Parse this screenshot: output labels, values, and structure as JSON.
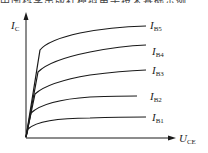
{
  "top_text": "中国科学出版社模拟电子技术基础示例",
  "diagram": {
    "y_axis": {
      "label_main": "I",
      "label_sub": "C"
    },
    "x_axis": {
      "label_main": "U",
      "label_sub": "CE"
    },
    "curves": [
      {
        "label_main": "I",
        "label_sub": "B5",
        "d": "M26,137 L40,50 Q48,40 80,33 Q110,27 146,26",
        "lx": 150,
        "ly": 29
      },
      {
        "label_main": "I",
        "label_sub": "B4",
        "d": "M26,137 L38,72 Q50,60 90,52 Q120,46 146,45",
        "lx": 152,
        "ly": 55
      },
      {
        "label_main": "I",
        "label_sub": "B3",
        "d": "M26,137 L35,94 Q48,82 90,75 Q120,71 146,70",
        "lx": 152,
        "ly": 74
      },
      {
        "label_main": "I",
        "label_sub": "B2",
        "d": "M26,137 L31,113 Q45,100 90,97 Q120,96 137,96",
        "lx": 150,
        "ly": 100
      },
      {
        "label_main": "I",
        "label_sub": "B1",
        "d": "M26,137 L28,129 Q40,118 90,118 Q120,117 146,117",
        "lx": 152,
        "ly": 121
      }
    ]
  },
  "colors": {
    "line": "#1a1a1a",
    "text": "#222222"
  }
}
